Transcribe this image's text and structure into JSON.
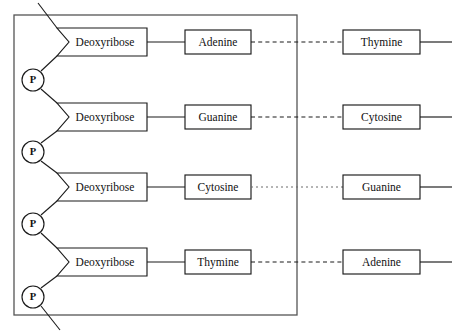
{
  "diagram": {
    "frame": {
      "x": 14,
      "y": 15,
      "width": 283,
      "height": 300,
      "color": "#555555"
    },
    "colors": {
      "stroke": "#1a1a1a",
      "frame": "#555555",
      "dotted": "#6a6a6a",
      "background": "#ffffff"
    },
    "sugar_label": "Deoxyribose",
    "phosphate_label": "P",
    "rows": [
      {
        "id": "row-1",
        "y": 42,
        "sugar": "Deoxyribose",
        "left_base": "Adenine",
        "right_base": "Thymine",
        "bond_style": "dashed"
      },
      {
        "id": "row-2",
        "y": 117,
        "sugar": "Deoxyribose",
        "left_base": "Guanine",
        "right_base": "Cytosine",
        "bond_style": "dashed"
      },
      {
        "id": "row-3",
        "y": 187,
        "sugar": "Deoxyribose",
        "left_base": "Cytosine",
        "right_base": "Guanine",
        "bond_style": "dotted"
      },
      {
        "id": "row-4",
        "y": 262,
        "sugar": "Deoxyribose",
        "left_base": "Thymine",
        "right_base": "Adenine",
        "bond_style": "dashed"
      }
    ],
    "phosphates": [
      {
        "id": "phosphate-1",
        "label": "P",
        "cx": 33,
        "cy": 80
      },
      {
        "id": "phosphate-2",
        "label": "P",
        "cx": 33,
        "cy": 152
      },
      {
        "id": "phosphate-3",
        "label": "P",
        "cx": 33,
        "cy": 224
      },
      {
        "id": "phosphate-4",
        "label": "P",
        "cx": 33,
        "cy": 297
      }
    ],
    "geometry": {
      "sugar_box": {
        "x": 57,
        "y_offset": -14,
        "width": 90,
        "height": 28
      },
      "left_base_box": {
        "x": 185,
        "y_offset": -12,
        "width": 66,
        "height": 24
      },
      "right_base_box": {
        "x": 343,
        "y_offset": -12,
        "width": 77,
        "height": 24
      },
      "right_tail_end": 452,
      "sugar_notch_depth": 12,
      "phosphate_radius": 11
    }
  }
}
